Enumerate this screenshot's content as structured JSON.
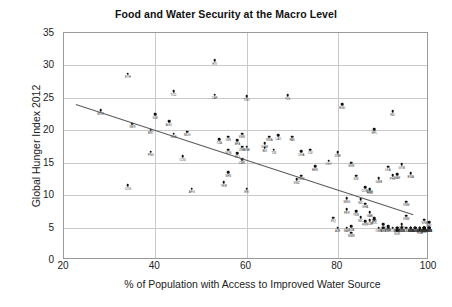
{
  "chart_data": {
    "type": "scatter",
    "title": "Food and Water Security at the Macro Level",
    "xlabel": "% of Population with Access to Improved Water Source",
    "ylabel": "Global Hunger Index 2012",
    "xlim": [
      20,
      100
    ],
    "ylim": [
      0,
      35
    ],
    "xticks": [
      20,
      40,
      60,
      80,
      100
    ],
    "yticks": [
      0,
      5,
      10,
      15,
      20,
      25,
      30,
      35
    ],
    "grid": true,
    "legend": "none",
    "point_label_field": "country_code",
    "trendline": {
      "visible": true,
      "x_start": 22.6,
      "y_start": 24.0,
      "x_end": 96.5,
      "y_end": 7.0,
      "description": "negative linear fit"
    },
    "points": [
      {
        "country_code": "MOZ",
        "x": 28.0,
        "y": 23.1
      },
      {
        "country_code": "ETH",
        "x": 34.0,
        "y": 28.7
      },
      {
        "country_code": "NER",
        "x": 35.0,
        "y": 21.0
      },
      {
        "country_code": "SLE",
        "x": 40.0,
        "y": 22.5
      },
      {
        "country_code": "AGO",
        "x": 43.0,
        "y": 21.4
      },
      {
        "country_code": "MRT",
        "x": 39.0,
        "y": 20.1
      },
      {
        "country_code": "TCD",
        "x": 44.0,
        "y": 26.0
      },
      {
        "country_code": "COG",
        "x": 34.0,
        "y": 11.5
      },
      {
        "country_code": "HTI",
        "x": 53.0,
        "y": 30.8
      },
      {
        "country_code": "CAF",
        "x": 53.0,
        "y": 25.5
      },
      {
        "country_code": "TGO",
        "x": 60.0,
        "y": 25.3
      },
      {
        "country_code": "MDG",
        "x": 47.0,
        "y": 19.8
      },
      {
        "country_code": "NGA",
        "x": 44.0,
        "y": 19.5
      },
      {
        "country_code": "PNG",
        "x": 39.0,
        "y": 16.7
      },
      {
        "country_code": "TZA",
        "x": 54.0,
        "y": 18.6
      },
      {
        "country_code": "BFA",
        "x": 58.0,
        "y": 18.5
      },
      {
        "country_code": "ZMB",
        "x": 59.0,
        "y": 17.5
      },
      {
        "country_code": "SDN",
        "x": 56.0,
        "y": 17.0
      },
      {
        "country_code": "MLI",
        "x": 58.0,
        "y": 16.5
      },
      {
        "country_code": "COD",
        "x": 46.0,
        "y": 16.0
      },
      {
        "country_code": "GIN",
        "x": 56.0,
        "y": 19.0
      },
      {
        "country_code": "GNB",
        "x": 60.0,
        "y": 17.5
      },
      {
        "country_code": "CMR",
        "x": 59.0,
        "y": 15.5
      },
      {
        "country_code": "BDI",
        "x": 64.0,
        "y": 17.3
      },
      {
        "country_code": "LAO",
        "x": 67.0,
        "y": 19.2
      },
      {
        "country_code": "RWA",
        "x": 65.0,
        "y": 19.0
      },
      {
        "country_code": "PAK",
        "x": 70.0,
        "y": 19.0
      },
      {
        "country_code": "CIV",
        "x": 74.0,
        "y": 17.0
      },
      {
        "country_code": "SEN",
        "x": 56.0,
        "y": 13.5
      },
      {
        "country_code": "KEN",
        "x": 59.0,
        "y": 19.5
      },
      {
        "country_code": "AFG",
        "x": 48.0,
        "y": 11.0
      },
      {
        "country_code": "UGA",
        "x": 72.0,
        "y": 16.8
      },
      {
        "country_code": "BEN",
        "x": 75.0,
        "y": 14.5
      },
      {
        "country_code": "GHA",
        "x": 86.0,
        "y": 8.7
      },
      {
        "country_code": "MWI",
        "x": 83.0,
        "y": 15.0
      },
      {
        "country_code": "ZWE",
        "x": 80.0,
        "y": 16.6
      },
      {
        "country_code": "NPL",
        "x": 88.0,
        "y": 20.2
      },
      {
        "country_code": "IND",
        "x": 92.0,
        "y": 22.9
      },
      {
        "country_code": "BGD",
        "x": 81.0,
        "y": 24.0
      },
      {
        "country_code": "TLS",
        "x": 69.0,
        "y": 25.4
      },
      {
        "country_code": "YEM",
        "x": 55.0,
        "y": 12.0
      },
      {
        "country_code": "ERI",
        "x": 60.0,
        "y": 11.0
      },
      {
        "country_code": "SWZ",
        "x": 71.0,
        "y": 12.5
      },
      {
        "country_code": "COM",
        "x": 87.0,
        "y": 11.0
      },
      {
        "country_code": "NIC",
        "x": 85.0,
        "y": 9.4
      },
      {
        "country_code": "PER",
        "x": 82.0,
        "y": 7.8
      },
      {
        "country_code": "PRY",
        "x": 86.0,
        "y": 6.0
      },
      {
        "country_code": "MMR",
        "x": 83.0,
        "y": 4.2
      },
      {
        "country_code": "BOL",
        "x": 88.0,
        "y": 6.3
      },
      {
        "country_code": "CIV2",
        "x": 90.0,
        "y": 5.5
      },
      {
        "country_code": "SLV",
        "x": 88.0,
        "y": 6.5
      },
      {
        "country_code": "DOM",
        "x": 86.0,
        "y": 11.2
      },
      {
        "country_code": "GTM",
        "x": 94.0,
        "y": 14.8
      },
      {
        "country_code": "KHM",
        "x": 64.0,
        "y": 18.0
      },
      {
        "country_code": "TJK",
        "x": 66.0,
        "y": 17.0
      },
      {
        "country_code": "LKA",
        "x": 91.0,
        "y": 14.4
      },
      {
        "country_code": "PHL",
        "x": 92.0,
        "y": 13.1
      },
      {
        "country_code": "IDN",
        "x": 84.0,
        "y": 13.0
      },
      {
        "country_code": "VNM",
        "x": 95.0,
        "y": 9.0
      },
      {
        "country_code": "MNG",
        "x": 82.0,
        "y": 9.5
      },
      {
        "country_code": "HND",
        "x": 87.0,
        "y": 10.9
      },
      {
        "country_code": "BWA",
        "x": 96.0,
        "y": 13.4
      },
      {
        "country_code": "NAM",
        "x": 93.0,
        "y": 13.2
      },
      {
        "country_code": "LSO",
        "x": 78.0,
        "y": 15.3
      },
      {
        "country_code": "SWZ2",
        "x": 72.0,
        "y": 13.0
      },
      {
        "country_code": "GMB",
        "x": 89.0,
        "y": 12.6
      },
      {
        "country_code": "MAR",
        "x": 82.0,
        "y": 5.0
      },
      {
        "country_code": "EGY",
        "x": 99.0,
        "y": 5.0
      },
      {
        "country_code": "TUN",
        "x": 96.0,
        "y": 5.0
      },
      {
        "country_code": "DZA",
        "x": 83.0,
        "y": 5.2
      },
      {
        "country_code": "JOR",
        "x": 97.0,
        "y": 5.0
      },
      {
        "country_code": "SYR",
        "x": 90.0,
        "y": 5.0
      },
      {
        "country_code": "IRN",
        "x": 96.0,
        "y": 5.0
      },
      {
        "country_code": "TUR",
        "x": 99.0,
        "y": 5.0
      },
      {
        "country_code": "LBN",
        "x": 100.0,
        "y": 5.0
      },
      {
        "country_code": "MEX",
        "x": 94.0,
        "y": 5.0
      },
      {
        "country_code": "CHL",
        "x": 98.0,
        "y": 5.0
      },
      {
        "country_code": "ARG",
        "x": 99.0,
        "y": 5.0
      },
      {
        "country_code": "URY",
        "x": 100.0,
        "y": 5.0
      },
      {
        "country_code": "BRA",
        "x": 97.0,
        "y": 5.0
      },
      {
        "country_code": "CRI",
        "x": 96.0,
        "y": 5.0
      },
      {
        "country_code": "CUB",
        "x": 94.0,
        "y": 5.0
      },
      {
        "country_code": "PAN",
        "x": 93.0,
        "y": 5.0
      },
      {
        "country_code": "ECU",
        "x": 94.0,
        "y": 5.1
      },
      {
        "country_code": "COL",
        "x": 92.0,
        "y": 5.0
      },
      {
        "country_code": "VEN",
        "x": 93.0,
        "y": 5.0
      },
      {
        "country_code": "JAM",
        "x": 93.0,
        "y": 5.0
      },
      {
        "country_code": "TTO",
        "x": 94.0,
        "y": 5.0
      },
      {
        "country_code": "MYS",
        "x": 100.0,
        "y": 5.0
      },
      {
        "country_code": "THA",
        "x": 96.0,
        "y": 5.0
      },
      {
        "country_code": "CHN",
        "x": 91.0,
        "y": 5.2
      },
      {
        "country_code": "UZB",
        "x": 87.0,
        "y": 6.1
      },
      {
        "country_code": "KGZ",
        "x": 90.0,
        "y": 5.0
      },
      {
        "country_code": "AZE",
        "x": 80.0,
        "y": 5.0
      },
      {
        "country_code": "ARM",
        "x": 99.0,
        "y": 5.0
      },
      {
        "country_code": "GEO",
        "x": 98.0,
        "y": 5.0
      },
      {
        "country_code": "MDA",
        "x": 96.0,
        "y": 5.0
      },
      {
        "country_code": "UKR",
        "x": 98.0,
        "y": 5.0
      },
      {
        "country_code": "RUS",
        "x": 97.0,
        "y": 5.0
      },
      {
        "country_code": "BLR",
        "x": 100.0,
        "y": 5.0
      },
      {
        "country_code": "KAZ",
        "x": 95.0,
        "y": 5.0
      },
      {
        "country_code": "ROU",
        "x": 99.0,
        "y": 5.0
      },
      {
        "country_code": "BGR",
        "x": 100.0,
        "y": 5.0
      },
      {
        "country_code": "SRB",
        "x": 99.0,
        "y": 5.0
      },
      {
        "country_code": "HRV",
        "x": 99.0,
        "y": 5.0
      },
      {
        "country_code": "ALB",
        "x": 96.0,
        "y": 5.0
      },
      {
        "country_code": "MKD",
        "x": 100.0,
        "y": 5.0
      },
      {
        "country_code": "BIH",
        "x": 99.0,
        "y": 5.0
      },
      {
        "country_code": "ZAF",
        "x": 91.0,
        "y": 5.0
      },
      {
        "country_code": "MUS",
        "x": 99.0,
        "y": 5.0
      },
      {
        "country_code": "SAU",
        "x": 97.0,
        "y": 5.0
      },
      {
        "country_code": "KWT",
        "x": 99.0,
        "y": 5.0
      },
      {
        "country_code": "LBY",
        "x": 100.0,
        "y": 5.8
      },
      {
        "country_code": "OMN",
        "x": 89.0,
        "y": 5.0
      },
      {
        "country_code": "SUR",
        "x": 93.0,
        "y": 4.6
      },
      {
        "country_code": "GUY",
        "x": 94.0,
        "y": 5.5
      },
      {
        "country_code": "FJI",
        "x": 98.0,
        "y": 5.0
      },
      {
        "country_code": "VNM2",
        "x": 95.0,
        "y": 6.8
      },
      {
        "country_code": "IRQ",
        "x": 79.0,
        "y": 6.5
      },
      {
        "country_code": "NIC2",
        "x": 85.0,
        "y": 6.6
      },
      {
        "country_code": "SRB2",
        "x": 99.0,
        "y": 6.2
      },
      {
        "country_code": "TKM",
        "x": 84.0,
        "y": 7.5
      },
      {
        "country_code": "GAB",
        "x": 87.0,
        "y": 7.4
      },
      {
        "country_code": "MNE",
        "x": 98.0,
        "y": 4.8
      },
      {
        "country_code": "BLZ",
        "x": 99.0,
        "y": 4.9
      },
      {
        "country_code": "LCA",
        "x": 98.0,
        "y": 4.7
      }
    ]
  },
  "axes": {
    "x_tick_labels": [
      "20",
      "40",
      "60",
      "80",
      "100"
    ],
    "y_tick_labels": [
      "0",
      "5",
      "10",
      "15",
      "20",
      "25",
      "30",
      "35"
    ]
  }
}
